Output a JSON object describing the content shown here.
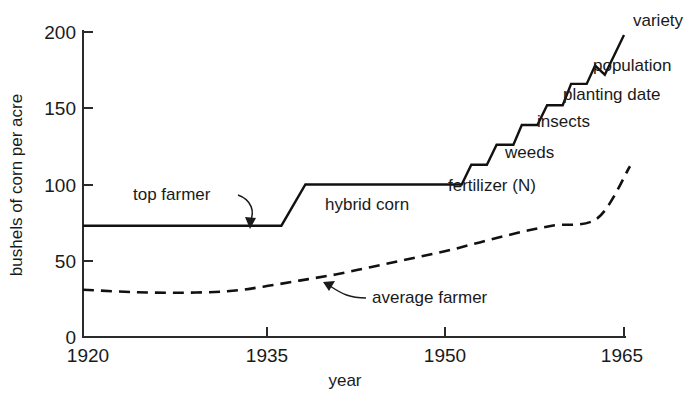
{
  "chart_data": {
    "type": "line",
    "title": "",
    "xlabel": "year",
    "ylabel": "bushels of corn per acre",
    "xlim": [
      1920,
      1965
    ],
    "ylim": [
      0,
      200
    ],
    "xticks": [
      1920,
      1935,
      1950,
      1965
    ],
    "xtick_labels": [
      "1920",
      "1935",
      "1950",
      "1965"
    ],
    "yticks": [
      0,
      50,
      100,
      150,
      200
    ],
    "ytick_labels": [
      "0",
      "50",
      "100",
      "150",
      "200"
    ],
    "grid": false,
    "legend": "none",
    "series": [
      {
        "name": "top farmer",
        "style": "solid",
        "points": [
          [
            1920,
            73
          ],
          [
            1936.5,
            73
          ],
          [
            1938.5,
            100
          ],
          [
            1951.5,
            100
          ],
          [
            1952.3,
            113
          ],
          [
            1953.6,
            113
          ],
          [
            1954.4,
            126
          ],
          [
            1955.8,
            126
          ],
          [
            1956.5,
            139
          ],
          [
            1957.8,
            139
          ],
          [
            1958.6,
            152
          ],
          [
            1959.9,
            152
          ],
          [
            1960.6,
            166
          ],
          [
            1961.9,
            166
          ],
          [
            1962.6,
            178
          ],
          [
            1963.4,
            172
          ],
          [
            1965.0,
            198
          ]
        ]
      },
      {
        "name": "average farmer",
        "style": "dashed",
        "points": [
          [
            1920,
            31
          ],
          [
            1924,
            29.5
          ],
          [
            1928,
            29
          ],
          [
            1932,
            30
          ],
          [
            1935,
            33
          ],
          [
            1938,
            37
          ],
          [
            1941,
            41
          ],
          [
            1944,
            46
          ],
          [
            1947,
            51
          ],
          [
            1950,
            56
          ],
          [
            1953,
            62
          ],
          [
            1956,
            68
          ],
          [
            1959,
            73
          ],
          [
            1962.8,
            78
          ],
          [
            1965.5,
            112
          ]
        ]
      }
    ],
    "annotations": [
      {
        "text": "top farmer",
        "role": "series-callout",
        "target_series": "top farmer"
      },
      {
        "text": "hybrid corn",
        "role": "plateau-label",
        "target_series": "top farmer"
      },
      {
        "text": "fertilizer (N)",
        "role": "step-label",
        "step": 1
      },
      {
        "text": "weeds",
        "role": "step-label",
        "step": 2
      },
      {
        "text": "insects",
        "role": "step-label",
        "step": 3
      },
      {
        "text": "planting date",
        "role": "step-label",
        "step": 4
      },
      {
        "text": "population",
        "role": "step-label",
        "step": 5
      },
      {
        "text": "variety",
        "role": "step-label",
        "step": 6
      },
      {
        "text": "average farmer",
        "role": "series-callout",
        "target_series": "average farmer"
      }
    ]
  },
  "axis": {
    "y_title": "bushels of corn per acre",
    "x_title": "year",
    "y_labels": [
      "200",
      "150",
      "100",
      "50",
      "0"
    ],
    "x_labels": [
      "1920",
      "1935",
      "1950",
      "1965"
    ]
  },
  "labels": {
    "top_farmer": "top farmer",
    "hybrid_corn": "hybrid corn",
    "fertilizer": "fertilizer (N)",
    "weeds": "weeds",
    "insects": "insects",
    "planting_date": "planting date",
    "population": "population",
    "variety": "variety",
    "average_farmer": "average farmer"
  },
  "colors": {
    "line": "#111111",
    "axis": "#2b2b2b",
    "text": "#1a1a1a",
    "background": "#ffffff"
  }
}
